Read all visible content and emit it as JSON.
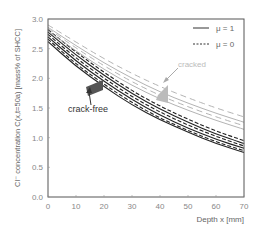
{
  "chart_data": {
    "type": "line",
    "title": "",
    "xlabel": "Depth x [mm]",
    "ylabel": "Cl⁻ concentration C(x,t=50a) [mass% of SHCC]",
    "xlim": [
      0,
      70
    ],
    "ylim": [
      0,
      3.0
    ],
    "xticks": [
      "0",
      "10",
      "20",
      "30",
      "40",
      "50",
      "60",
      "70"
    ],
    "yticks": [
      "0.0",
      "0.5",
      "1.0",
      "1.5",
      "2.0",
      "2.5",
      "3.0"
    ],
    "grid": false,
    "legend": {
      "position": "upper right",
      "entries": [
        {
          "label": "μ = 1",
          "style": "solid"
        },
        {
          "label": "μ = 0",
          "style": "dashed"
        }
      ]
    },
    "annotations": [
      {
        "text": "crack-free",
        "x": 20,
        "y": 1.85,
        "color": "#333333"
      },
      {
        "text": "cracked",
        "x": 39,
        "y": 1.7,
        "color": "#aaaaaa"
      }
    ],
    "x": [
      0,
      10,
      20,
      30,
      40,
      50,
      60,
      70
    ],
    "series": [
      {
        "name": "crack-free μ=1 (a)",
        "group": "crack-free",
        "style": "solid",
        "color": "#222222",
        "values": [
          2.62,
          2.2,
          1.86,
          1.55,
          1.3,
          1.09,
          0.9,
          0.75
        ]
      },
      {
        "name": "crack-free μ=0 (a)",
        "group": "crack-free",
        "style": "dashed",
        "color": "#222222",
        "values": [
          2.66,
          2.24,
          1.9,
          1.59,
          1.33,
          1.12,
          0.93,
          0.78
        ]
      },
      {
        "name": "crack-free μ=1 (b)",
        "group": "crack-free",
        "style": "solid",
        "color": "#222222",
        "values": [
          2.7,
          2.29,
          1.95,
          1.64,
          1.38,
          1.16,
          0.97,
          0.82
        ]
      },
      {
        "name": "crack-free μ=0 (b)",
        "group": "crack-free",
        "style": "dashed",
        "color": "#222222",
        "values": [
          2.74,
          2.34,
          2.0,
          1.69,
          1.43,
          1.21,
          1.02,
          0.86
        ]
      },
      {
        "name": "crack-free μ=1 (c)",
        "group": "crack-free",
        "style": "solid",
        "color": "#222222",
        "values": [
          2.78,
          2.39,
          2.05,
          1.74,
          1.48,
          1.26,
          1.06,
          0.9
        ]
      },
      {
        "name": "crack-free μ=0 (c)",
        "group": "crack-free",
        "style": "dashed",
        "color": "#222222",
        "values": [
          2.82,
          2.44,
          2.1,
          1.79,
          1.53,
          1.31,
          1.11,
          0.95
        ]
      },
      {
        "name": "cracked μ=1 (a)",
        "group": "cracked",
        "style": "solid",
        "color": "#aaaaaa",
        "values": [
          2.8,
          2.46,
          2.15,
          1.88,
          1.65,
          1.46,
          1.29,
          1.14
        ]
      },
      {
        "name": "cracked μ=0 (a)",
        "group": "cracked",
        "style": "dashed",
        "color": "#aaaaaa",
        "values": [
          2.84,
          2.51,
          2.21,
          1.94,
          1.71,
          1.52,
          1.35,
          1.2
        ]
      },
      {
        "name": "cracked μ=1 (b)",
        "group": "cracked",
        "style": "solid",
        "color": "#aaaaaa",
        "values": [
          2.86,
          2.55,
          2.26,
          2.0,
          1.77,
          1.58,
          1.41,
          1.26
        ]
      },
      {
        "name": "cracked μ=0 (b)",
        "group": "cracked",
        "style": "dashed",
        "color": "#aaaaaa",
        "values": [
          2.9,
          2.61,
          2.33,
          2.08,
          1.86,
          1.67,
          1.5,
          1.35
        ]
      }
    ]
  }
}
